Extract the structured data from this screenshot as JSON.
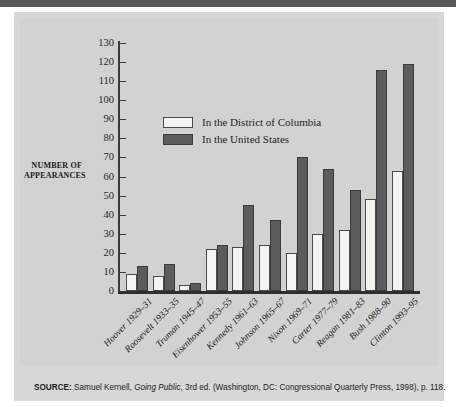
{
  "figure": {
    "y_axis_title": "NUMBER OF APPEARANCES",
    "source_lead": "SOURCE:",
    "source_before_title": " Samuel Kernell, ",
    "source_title": "Going Public",
    "source_after_title": ", 3rd ed. (Washington, DC: Congressional Quarterly Press, 1998), p. 118.",
    "colors": {
      "panel_background": "#d7d7d7",
      "plot_background": "#d2d2d2",
      "banner": "#58585a",
      "dc_bar": "#f4f4f2",
      "us_bar": "#5c5c5e",
      "axis": "#3a3a3a"
    }
  },
  "legend": {
    "position": "inside-top-left",
    "entries": [
      {
        "label": "In the District of Columbia",
        "swatch": "dc"
      },
      {
        "label": "In the United States",
        "swatch": "us"
      }
    ]
  },
  "chart_data": {
    "type": "bar",
    "title": "",
    "subtitle": "",
    "xlabel": "",
    "ylabel": "NUMBER OF APPEARANCES",
    "ylim": [
      0,
      130
    ],
    "ytick_step": 10,
    "yticks": [
      0,
      10,
      20,
      30,
      40,
      50,
      60,
      70,
      80,
      90,
      100,
      110,
      120,
      130
    ],
    "ytick_labels": [
      "0",
      "10",
      "20",
      "30",
      "40",
      "50",
      "60",
      "70",
      "80",
      "90",
      "100",
      "110",
      "120",
      "130"
    ],
    "grid": false,
    "legend_position": "upper left (inside plot)",
    "categories": [
      "Hoover 1929–31",
      "Roosevelt 1933–35",
      "Truman 1945–47",
      "Eisenhower 1953–55",
      "Kennedy 1961–63",
      "Johnson 1965–67",
      "Nixon 1969–71",
      "Carter 1977–79",
      "Reagan 1981–83",
      "Bush 1988–90",
      "Clinton 1993–95"
    ],
    "series": [
      {
        "name": "In the District of Columbia",
        "color": "#f4f4f2",
        "values": [
          9,
          8,
          3,
          22,
          23,
          24,
          20,
          30,
          32,
          48,
          63
        ]
      },
      {
        "name": "In the United States",
        "color": "#5c5c5e",
        "values": [
          13,
          14,
          4,
          24,
          45,
          37,
          70,
          64,
          53,
          116,
          119
        ]
      }
    ]
  }
}
